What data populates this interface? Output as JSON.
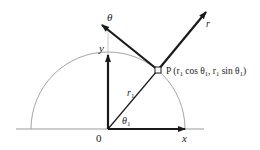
{
  "diagram": {
    "origin_label": "0",
    "x_axis_label": "x",
    "y_axis_label": "y",
    "radius_label": "r",
    "radius_subscript": "1",
    "angle_label": "θ",
    "angle_subscript": "1",
    "r_hat_label": "r",
    "theta_hat_label": "θ",
    "point": {
      "name": "P",
      "coords_text": "(r",
      "sub1": "1",
      "cos_text": " cos θ",
      "sub2": "1",
      "sep_text": ", r",
      "sub3": "1",
      "sin_text": " sin θ",
      "sub4": "1",
      "close_text": ")"
    },
    "colors": {
      "arrow": "#1a1a1a",
      "axis": "#9a9a9a",
      "arc": "#9a9a9a",
      "text": "#222222"
    }
  }
}
